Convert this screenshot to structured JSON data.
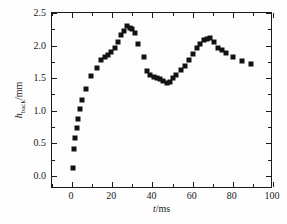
{
  "chart_data": {
    "type": "scatter",
    "title": "",
    "xlabel": "t/ms",
    "ylabel": "h_back/mm",
    "xlabel_parts": {
      "symbol": "t",
      "unit": "/ms"
    },
    "ylabel_parts": {
      "symbol": "h",
      "subscript": "back",
      "unit": "/mm"
    },
    "xlim": [
      -10,
      100
    ],
    "ylim": [
      -0.2,
      2.5
    ],
    "xticks": [
      0,
      20,
      40,
      60,
      80,
      100
    ],
    "xticklabels": [
      "0",
      "20",
      "40",
      "60",
      "80",
      "100"
    ],
    "yticks": [
      0.0,
      0.5,
      1.0,
      1.5,
      2.0,
      2.5
    ],
    "yticklabels": [
      "0.0",
      "0.5",
      "1.0",
      "1.5",
      "2.0",
      "2.5"
    ],
    "xminor_step": 10,
    "yminor_step": 0.25,
    "grid": false,
    "legend": false,
    "marker": "square",
    "marker_color": "#121212",
    "marker_size_px": 5,
    "x": [
      0.6,
      1.0,
      1.5,
      2.2,
      3.0,
      3.8,
      5.0,
      7.0,
      9.2,
      12.4,
      14.2,
      16.2,
      17.8,
      19.6,
      21.4,
      23.0,
      24.4,
      25.8,
      27.2,
      28.6,
      30.0,
      31.4,
      33.0,
      35.6,
      37.4,
      39.0,
      40.6,
      42.2,
      43.8,
      45.4,
      47.0,
      48.6,
      50.2,
      51.8,
      54.0,
      56.2,
      58.0,
      60.0,
      62.0,
      63.8,
      65.6,
      67.2,
      68.8,
      70.6,
      72.6,
      74.6,
      76.6,
      80.0,
      84.4,
      89.0
    ],
    "y": [
      0.12,
      0.42,
      0.58,
      0.74,
      0.88,
      1.02,
      1.17,
      1.33,
      1.53,
      1.65,
      1.78,
      1.82,
      1.86,
      1.9,
      1.97,
      2.05,
      2.16,
      2.23,
      2.3,
      2.27,
      2.25,
      2.19,
      2.02,
      1.83,
      1.61,
      1.55,
      1.52,
      1.5,
      1.49,
      1.46,
      1.43,
      1.44,
      1.5,
      1.55,
      1.62,
      1.68,
      1.78,
      1.87,
      1.97,
      2.02,
      2.08,
      2.1,
      2.12,
      2.06,
      1.96,
      1.94,
      1.89,
      1.82,
      1.76,
      1.72
    ]
  }
}
